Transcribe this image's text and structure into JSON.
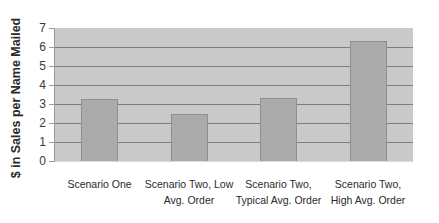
{
  "chart_data": {
    "type": "bar",
    "title": "",
    "xlabel": "",
    "ylabel": "$ in Sales per Name Mailed",
    "ylim": [
      0,
      7
    ],
    "yticks": [
      0,
      1,
      2,
      3,
      4,
      5,
      6,
      7
    ],
    "grid": true,
    "legend": null,
    "categories": [
      "Scenario One",
      "Scenario Two, Low Avg. Order",
      "Scenario Two, Typical Avg. Order",
      "Scenario Two, High Avg. Order"
    ],
    "values": [
      3.25,
      2.5,
      3.3,
      6.3
    ]
  },
  "labels": {
    "ylabel": "$ in Sales per Name Mailed",
    "yticks": [
      "0",
      "1",
      "2",
      "3",
      "4",
      "5",
      "6",
      "7"
    ],
    "cat1": "Scenario One",
    "cat2": "Scenario Two, Low Avg. Order",
    "cat3": "Scenario Two, Typical Avg. Order",
    "cat4": "Scenario Two, High Avg. Order"
  }
}
